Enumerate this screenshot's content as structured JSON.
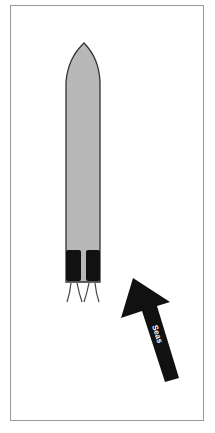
{
  "diagram": {
    "vessel": {
      "label": "vessel",
      "hull_color": "#b8b8b8",
      "outline_color": "#333333",
      "thruster_color": "#111111"
    },
    "seas_arrow": {
      "label": "Seas",
      "color": "#111111",
      "text_color": "#ffffff"
    }
  }
}
